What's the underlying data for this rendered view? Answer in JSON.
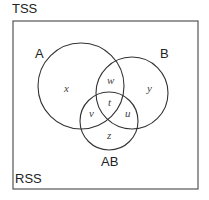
{
  "diagram": {
    "type": "venn",
    "outer_label_top": "TSS",
    "outer_label_bottom": "RSS",
    "sets": [
      {
        "name": "A",
        "cx": 81,
        "cy": 86,
        "r": 43
      },
      {
        "name": "B",
        "cx": 132,
        "cy": 93,
        "r": 36
      },
      {
        "name": "AB",
        "cx": 109,
        "cy": 121,
        "r": 29
      }
    ],
    "regions": {
      "x": "x",
      "y": "y",
      "w": "w",
      "t": "t",
      "u": "u",
      "v": "v",
      "z": "z"
    },
    "colors": {
      "stroke": "#333333",
      "box": "#555555",
      "text": "#222222"
    }
  }
}
